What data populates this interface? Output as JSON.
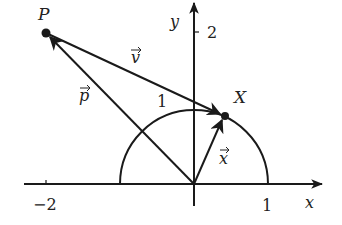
{
  "diagram": {
    "type": "vector-diagram",
    "axes": {
      "x_label": "x",
      "y_label": "y",
      "x_ticks": [
        {
          "value": -2,
          "label": "−2"
        },
        {
          "value": 1,
          "label": "1"
        }
      ],
      "y_ticks": [
        {
          "value": 2,
          "label": "2"
        }
      ]
    },
    "semicircle": {
      "center": [
        0,
        0
      ],
      "radius": 1,
      "radius_label": "1"
    },
    "points": [
      {
        "name": "P",
        "label": "P",
        "coords": [
          -2,
          2
        ]
      },
      {
        "name": "X",
        "label": "X",
        "coords": [
          0.42,
          0.91
        ]
      }
    ],
    "vectors": [
      {
        "name": "p",
        "label": "p",
        "from": "O",
        "to": "P"
      },
      {
        "name": "v",
        "label": "v",
        "from": "P",
        "to": "X"
      },
      {
        "name": "x",
        "label": "x",
        "from": "O",
        "to": "X"
      }
    ],
    "colors": {
      "ink": "#1a1a1a",
      "background": "#ffffff"
    }
  }
}
